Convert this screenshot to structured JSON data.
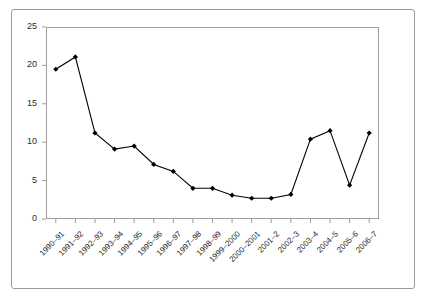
{
  "chart_data": {
    "type": "line",
    "title": "",
    "subtitle": "",
    "xlabel": "",
    "ylabel": "",
    "categories": [
      "1990–91",
      "1991–92",
      "1992–93",
      "1993–94",
      "1994–95",
      "1995–96",
      "1996–97",
      "1997–98",
      "1998–99",
      "1999–2000",
      "2000–2001",
      "2001–2",
      "2002–3",
      "2003–4",
      "2004–5",
      "2005–6",
      "2006–7"
    ],
    "values": [
      19.5,
      21.1,
      11.2,
      9.1,
      9.5,
      7.1,
      6.2,
      4.0,
      4.0,
      3.1,
      2.7,
      2.7,
      3.2,
      10.4,
      11.5,
      4.4,
      11.2
    ],
    "ylim": [
      0,
      25
    ],
    "yticks": [
      0,
      5,
      10,
      15,
      20,
      25
    ],
    "ytick_labels": [
      "0",
      "5",
      "10",
      "15",
      "20",
      "25"
    ],
    "grid": false,
    "legend": false,
    "legend_position": "none",
    "series": [
      {
        "name": "",
        "values": [
          19.5,
          21.1,
          11.2,
          9.1,
          9.5,
          7.1,
          6.2,
          4.0,
          4.0,
          3.1,
          2.7,
          2.7,
          3.2,
          10.4,
          11.5,
          4.4,
          11.2
        ],
        "color": "#000000",
        "marker": "diamond"
      }
    ]
  },
  "style": {
    "line_color": "#000000",
    "marker_color": "#000000",
    "axis_color": "#9e9e9e",
    "frame_color": "#9a9a9a",
    "text_color": "#2b2b2b",
    "background": "#ffffff"
  }
}
